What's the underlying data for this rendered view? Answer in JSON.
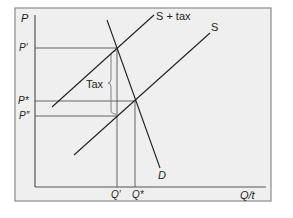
{
  "diagram": {
    "type": "supply-demand-tax",
    "colors": {
      "panel_bg": "#efefef",
      "frame": "#8a8a8a",
      "line": "#231f20",
      "guide": "#555555"
    },
    "axes": {
      "y_label": "P",
      "x_label": "Q/t"
    },
    "price_labels": {
      "p_prime": "P′",
      "p_star": "P*",
      "p_double_prime": "P″"
    },
    "quantity_labels": {
      "q_prime": "Q′",
      "q_star": "Q*"
    },
    "curves": {
      "supply_tax": "S + tax",
      "supply": "S",
      "demand": "D"
    },
    "annotations": {
      "tax": "Tax"
    }
  }
}
